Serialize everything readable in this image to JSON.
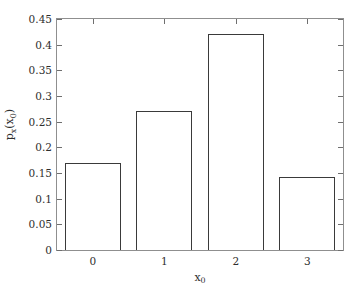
{
  "chart_data": {
    "type": "bar",
    "title": "",
    "subtitle": "",
    "categories": [
      "0",
      "1",
      "2",
      "3"
    ],
    "values": [
      0.17,
      0.27,
      0.42,
      0.143
    ],
    "xlabel": "x0",
    "ylabel": "px(x0)",
    "xlabel_base": "x",
    "xlabel_sub": "0",
    "ylabel_p": "p",
    "ylabel_p_sub": "x",
    "ylabel_open": "(x",
    "ylabel_arg_sub": "0",
    "ylabel_close": ")",
    "ylim": [
      0,
      0.45
    ],
    "yticks": [
      0,
      0.05,
      0.1,
      0.15,
      0.2,
      0.25,
      0.3,
      0.35,
      0.4,
      0.45
    ],
    "ytick_labels": [
      "0",
      "0.05",
      "0.1",
      "0.15",
      "0.2",
      "0.25",
      "0.3",
      "0.35",
      "0.4",
      "0.45"
    ],
    "xtick_labels": [
      "0",
      "1",
      "2",
      "3"
    ],
    "grid": false,
    "legend": null,
    "legend_position": "none",
    "bar_fill": "#ffffff",
    "bar_edge": "#3a3a3a",
    "axis_color": "#8f8f8f",
    "background": "#ffffff",
    "annotations": []
  }
}
